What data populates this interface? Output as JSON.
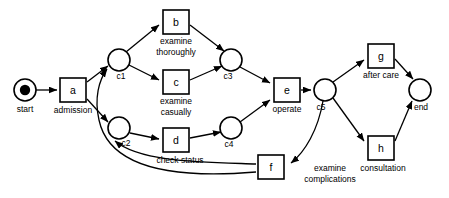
{
  "diagram": {
    "type": "petri-net",
    "title": "",
    "background_color": "#ffffff",
    "stroke_color": "#000000"
  },
  "places": [
    {
      "id": "start",
      "label": "start",
      "tokens": 1,
      "cx": 25,
      "cy": 90,
      "r": 11
    },
    {
      "id": "c1",
      "label": "c1",
      "tokens": 0,
      "cx": 119,
      "cy": 60,
      "r": 11
    },
    {
      "id": "c2",
      "label": "c2",
      "tokens": 0,
      "cx": 119,
      "cy": 128,
      "r": 11
    },
    {
      "id": "c3",
      "label": "c3",
      "tokens": 0,
      "cx": 231,
      "cy": 60,
      "r": 11
    },
    {
      "id": "c4",
      "label": "c4",
      "tokens": 0,
      "cx": 231,
      "cy": 128,
      "r": 11
    },
    {
      "id": "c5",
      "label": "c5",
      "tokens": 0,
      "cx": 325,
      "cy": 90,
      "r": 11
    },
    {
      "id": "end",
      "label": "end",
      "tokens": 0,
      "cx": 420,
      "cy": 90,
      "r": 11
    }
  ],
  "transitions": [
    {
      "id": "a",
      "letter": "a",
      "label": "admission",
      "x": 60,
      "y": 78,
      "w": 26,
      "h": 24
    },
    {
      "id": "b",
      "letter": "b",
      "label": "examine\nthoroughly",
      "x": 163,
      "y": 10,
      "w": 26,
      "h": 24
    },
    {
      "id": "c",
      "letter": "c",
      "label": "examine\ncasually",
      "x": 163,
      "y": 70,
      "w": 26,
      "h": 24
    },
    {
      "id": "d",
      "letter": "d",
      "label": "check status",
      "x": 163,
      "y": 128,
      "w": 26,
      "h": 24
    },
    {
      "id": "e",
      "letter": "e",
      "label": "operate",
      "x": 274,
      "y": 78,
      "w": 26,
      "h": 24
    },
    {
      "id": "f",
      "letter": "f",
      "label": "examine\ncomplications",
      "x": 258,
      "y": 155,
      "w": 26,
      "h": 24
    },
    {
      "id": "g",
      "letter": "g",
      "label": "after care",
      "x": 368,
      "y": 44,
      "w": 26,
      "h": 24
    },
    {
      "id": "h",
      "letter": "h",
      "label": "consultation",
      "x": 368,
      "y": 136,
      "w": 26,
      "h": 24
    }
  ],
  "transition_letters": {
    "a": "a",
    "b": "b",
    "c": "c",
    "d": "d",
    "e": "e",
    "f": "f",
    "g": "g",
    "h": "h"
  },
  "transition_labels": {
    "a": "admission",
    "b_line1": "examine",
    "b_line2": "thoroughly",
    "c_line1": "examine",
    "c_line2": "casually",
    "d": "check status",
    "e": "operate",
    "f_line1": "examine",
    "f_line2": "complications",
    "g": "after care",
    "h": "consultation"
  },
  "place_labels": {
    "start": "start",
    "c1": "c1",
    "c2": "c2",
    "c3": "c3",
    "c4": "c4",
    "c5": "c5",
    "end": "end"
  },
  "arcs": [
    {
      "from": "start",
      "to": "a",
      "kind": "straight"
    },
    {
      "from": "a",
      "to": "c1",
      "kind": "straight"
    },
    {
      "from": "a",
      "to": "c2",
      "kind": "straight"
    },
    {
      "from": "c1",
      "to": "b",
      "kind": "straight"
    },
    {
      "from": "c1",
      "to": "c",
      "kind": "straight"
    },
    {
      "from": "b",
      "to": "c3",
      "kind": "straight"
    },
    {
      "from": "c",
      "to": "c3",
      "kind": "straight"
    },
    {
      "from": "c2",
      "to": "d",
      "kind": "straight"
    },
    {
      "from": "d",
      "to": "c4",
      "kind": "straight"
    },
    {
      "from": "c3",
      "to": "e",
      "kind": "straight"
    },
    {
      "from": "c4",
      "to": "e",
      "kind": "straight"
    },
    {
      "from": "e",
      "to": "c5",
      "kind": "straight"
    },
    {
      "from": "c5",
      "to": "g",
      "kind": "straight"
    },
    {
      "from": "c5",
      "to": "h",
      "kind": "straight"
    },
    {
      "from": "g",
      "to": "end",
      "kind": "straight"
    },
    {
      "from": "h",
      "to": "end",
      "kind": "straight"
    },
    {
      "from": "c5",
      "to": "f",
      "kind": "curve"
    },
    {
      "from": "f",
      "to": "c1",
      "kind": "curve"
    },
    {
      "from": "f",
      "to": "c2",
      "kind": "curve"
    }
  ]
}
